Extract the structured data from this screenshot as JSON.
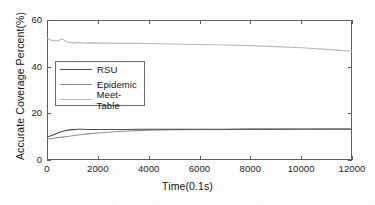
{
  "chart_data": {
    "type": "line",
    "title": "",
    "xlabel": "Time(0.1s)",
    "ylabel": "Accurate Coverage Percent(%)",
    "xlim": [
      0,
      12000
    ],
    "ylim": [
      0,
      60
    ],
    "xticks": [
      0,
      2000,
      4000,
      6000,
      8000,
      10000,
      12000
    ],
    "yticks": [
      0,
      20,
      40,
      60
    ],
    "xtick_labels": [
      "0",
      "2000",
      "4000",
      "6000",
      "8000",
      "10000",
      "12000"
    ],
    "ytick_labels": [
      "0",
      "20",
      "40",
      "60"
    ],
    "grid": false,
    "legend_position": "upper-left-inside",
    "series": [
      {
        "name": "RSU",
        "color": "#4a4a4a",
        "x": [
          0,
          100,
          200,
          300,
          400,
          500,
          600,
          700,
          800,
          900,
          1000,
          1100,
          1200,
          1400,
          1600,
          1800,
          2000,
          2400,
          2800,
          3200,
          3600,
          4000,
          5000,
          6000,
          7000,
          8000,
          9000,
          10000,
          11000,
          12000
        ],
        "y": [
          10.0,
          10.2,
          10.6,
          11.0,
          11.5,
          11.9,
          12.2,
          12.5,
          12.7,
          12.9,
          13.0,
          13.1,
          13.2,
          13.2,
          13.1,
          13.1,
          13.1,
          13.1,
          13.1,
          13.1,
          13.15,
          13.15,
          13.2,
          13.2,
          13.2,
          13.25,
          13.25,
          13.3,
          13.3,
          13.3
        ]
      },
      {
        "name": "Epidemic",
        "color": "#8e8e8e",
        "x": [
          0,
          200,
          400,
          600,
          800,
          1000,
          1200,
          1600,
          2000,
          2400,
          2800,
          3200,
          3600,
          4000,
          4500,
          5000,
          6000,
          7000,
          8000,
          9000,
          10000,
          11000,
          12000
        ],
        "y": [
          9.0,
          9.2,
          9.5,
          9.8,
          10.1,
          10.4,
          10.7,
          11.2,
          11.6,
          11.9,
          12.2,
          12.4,
          12.6,
          12.75,
          12.9,
          13.0,
          13.05,
          13.1,
          13.15,
          13.2,
          13.2,
          13.25,
          13.25
        ]
      },
      {
        "name": "Meet-Table",
        "color": "#b9b9b9",
        "x": [
          0,
          100,
          200,
          300,
          400,
          500,
          600,
          700,
          800,
          900,
          1000,
          1100,
          1200,
          1400,
          1600,
          1800,
          2000,
          2500,
          3000,
          3500,
          4000,
          5000,
          6000,
          7000,
          8000,
          9000,
          10000,
          11000,
          11500,
          12000
        ],
        "y": [
          52.2,
          51.6,
          51.1,
          51.3,
          50.9,
          51.4,
          51.8,
          51.2,
          50.6,
          50.4,
          50.3,
          50.1,
          50.4,
          50.2,
          50.1,
          50.2,
          50.1,
          50.1,
          50.0,
          50.0,
          49.9,
          49.7,
          49.5,
          49.3,
          49.0,
          48.6,
          48.1,
          47.4,
          47.0,
          46.6
        ]
      }
    ]
  },
  "legend": {
    "items": [
      {
        "label": "RSU"
      },
      {
        "label": "Epidemic"
      },
      {
        "label": "Meet-Table"
      }
    ]
  }
}
